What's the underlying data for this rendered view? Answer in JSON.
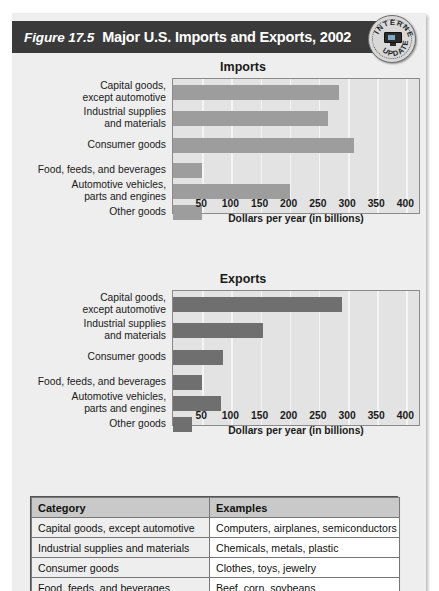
{
  "figure": {
    "number": "Figure 17.5",
    "title": "Major U.S. Imports and Exports, 2002",
    "seal": {
      "top_text": "INTERNET",
      "bottom_text": "UPDATE",
      "icon": "computer-monitor-icon"
    },
    "colors": {
      "title_bar": "#3a3a3a",
      "panel_bg": "#eeeeee",
      "plot_bg": "#e3e3e3",
      "imports_bar": "#9d9d9d",
      "exports_bar": "#6f6f6f",
      "gridline": "#f4f4f4",
      "table_header": "#c9c9c9"
    }
  },
  "chart_data": [
    {
      "type": "bar",
      "orientation": "horizontal",
      "title": "Imports",
      "xlabel": "Dollars per year (in billions)",
      "ylabel": "",
      "xlim": [
        0,
        425
      ],
      "xticks": [
        50,
        100,
        150,
        200,
        250,
        300,
        350,
        400
      ],
      "grid": true,
      "legend": "none",
      "categories": [
        "Capital goods,\nexcept automotive",
        "Industrial supplies\nand materials",
        "Consumer goods",
        "Food, feeds, and beverages",
        "Automotive vehicles,\nparts and engines",
        "Other goods"
      ],
      "values": [
        285,
        265,
        310,
        50,
        200,
        50
      ]
    },
    {
      "type": "bar",
      "orientation": "horizontal",
      "title": "Exports",
      "xlabel": "Dollars per year (in billions)",
      "ylabel": "",
      "xlim": [
        0,
        425
      ],
      "xticks": [
        50,
        100,
        150,
        200,
        250,
        300,
        350,
        400
      ],
      "grid": true,
      "legend": "none",
      "categories": [
        "Capital goods,\nexcept automotive",
        "Industrial supplies\nand materials",
        "Consumer goods",
        "Food, feeds, and beverages",
        "Automotive vehicles,\nparts and engines",
        "Other goods"
      ],
      "values": [
        290,
        155,
        85,
        50,
        82,
        32
      ]
    }
  ],
  "table": {
    "headers": [
      "Category",
      "Examples"
    ],
    "rows": [
      [
        "Capital goods, except automotive",
        "Computers, airplanes, semiconductors"
      ],
      [
        "Industrial supplies and materials",
        "Chemicals, metals, plastic"
      ],
      [
        "Consumer goods",
        "Clothes, toys, jewelry"
      ],
      [
        "Food, feeds, and beverages",
        "Beef, corn, soybeans"
      ]
    ]
  }
}
